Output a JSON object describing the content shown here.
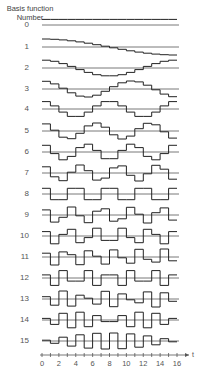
{
  "title_line1": "Basis function",
  "title_line2": "Number",
  "functions": [
    {
      "number": "0",
      "type": "DCT-II",
      "k": 0
    },
    {
      "number": "1",
      "type": "DCT-II",
      "k": 1
    },
    {
      "number": "2",
      "type": "DCT-II",
      "k": 2
    },
    {
      "number": "3",
      "type": "DCT-II",
      "k": 3
    },
    {
      "number": "4",
      "type": "DCT-II",
      "k": 4
    },
    {
      "number": "5",
      "type": "DCT-II",
      "k": 5
    },
    {
      "number": "6",
      "type": "DCT-II",
      "k": 6
    },
    {
      "number": "7",
      "type": "DCT-II",
      "k": 7
    },
    {
      "number": "8",
      "type": "DCT-II",
      "k": 8
    },
    {
      "number": "9",
      "type": "DCT-II",
      "k": 9
    },
    {
      "number": "10",
      "type": "DCT-II",
      "k": 10
    },
    {
      "number": "11",
      "type": "DCT-II",
      "k": 11
    },
    {
      "number": "12",
      "type": "DCT-II",
      "k": 12
    },
    {
      "number": "13",
      "type": "DCT-II",
      "k": 13
    },
    {
      "number": "14",
      "type": "DCT-II",
      "k": 14
    },
    {
      "number": "15",
      "type": "DCT-II",
      "k": 15
    }
  ],
  "axis": {
    "label": "t",
    "ticks": [
      "0",
      "2",
      "4",
      "6",
      "8",
      "10",
      "12",
      "14",
      "16"
    ],
    "range": [
      0,
      16
    ],
    "samples": 16
  },
  "colors": {
    "line": "#222222",
    "baseline": "#555555",
    "text": "#555555"
  }
}
